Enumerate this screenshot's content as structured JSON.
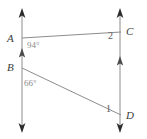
{
  "figure": {
    "type": "geometry-diagram",
    "width": 147,
    "height": 139,
    "background_color": "#ffffff",
    "line_color": "#8c8c8c",
    "label_color": "#3a3a3a",
    "angle_label_color": "#8a8a8a",
    "number_label_color": "#5a5a5a"
  },
  "points": {
    "A": {
      "label": "A",
      "x": 22,
      "y": 38
    },
    "B": {
      "label": "B",
      "x": 22,
      "y": 68
    },
    "C": {
      "label": "C",
      "x": 120,
      "y": 32
    },
    "D": {
      "label": "D",
      "x": 120,
      "y": 115
    }
  },
  "lines": {
    "left_vertical": {
      "name": "line-AB",
      "x": 22,
      "y_top": 10,
      "y_bottom": 131,
      "arrow_top": true,
      "arrow_bottom": true,
      "parallel_tick": "single-chevron-up"
    },
    "right_vertical": {
      "name": "line-CD",
      "x": 120,
      "y_top": 10,
      "y_bottom": 131,
      "arrow_top": true,
      "arrow_bottom": true,
      "parallel_tick": "single-chevron-up"
    },
    "transversal_AC": {
      "name": "segment-AC",
      "x1": 22,
      "y1": 38,
      "x2": 120,
      "y2": 32
    },
    "transversal_BD": {
      "name": "segment-BD",
      "x1": 22,
      "y1": 68,
      "x2": 120,
      "y2": 115
    }
  },
  "angles": {
    "at_A": {
      "value": "94°",
      "vertex": "A"
    },
    "at_B": {
      "value": "66°",
      "vertex": "B"
    },
    "at_C": {
      "value": "2",
      "vertex": "C"
    },
    "at_D": {
      "value": "1",
      "vertex": "D"
    }
  }
}
